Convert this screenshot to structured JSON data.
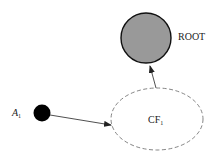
{
  "diagram": {
    "nodes": {
      "root": {
        "label": "ROOT",
        "fill": "#999999",
        "stroke": "#111111",
        "style": "solid"
      },
      "a1": {
        "label": "A",
        "sub": "1",
        "fill": "#000000"
      },
      "cf1": {
        "label": "CF",
        "sub": "1",
        "fill": "#ffffff",
        "stroke": "#666666",
        "style": "dashed"
      }
    },
    "edges": [
      {
        "from": "a1",
        "to": "cf1"
      },
      {
        "from": "cf1",
        "to": "root"
      }
    ]
  }
}
